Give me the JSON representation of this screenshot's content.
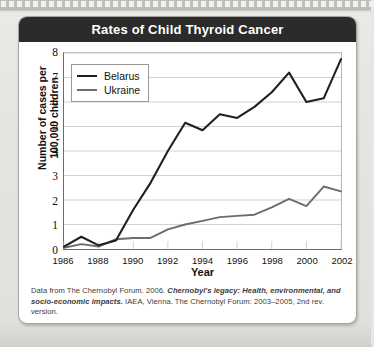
{
  "figure": {
    "title": "Rates of Child Thyroid Cancer",
    "caption_part1": "Data from The Chernobyl Forum. 2006. ",
    "caption_emphasis": "Chernobyl's legacy: Health, environmental, and socio-economic impacts.",
    "caption_part2": " IAEA, Vienna. The Chernobyl Forum: 2003–2005, 2nd rev. version."
  },
  "colors": {
    "header_bar": "#2b2b2b",
    "belarus_line": "#221f1f",
    "ukraine_line": "#6e6c6a",
    "gridline": "#cfcdcb",
    "axis": "#6e6c6a",
    "card_background": "#ffffff",
    "page_background": "#e8e6e3"
  },
  "chart_data": {
    "type": "line",
    "title": "Rates of Child Thyroid Cancer",
    "xlabel": "Year",
    "ylabel": "Number of cases per 100,000 children",
    "ylabel_line1": "Number of cases per",
    "ylabel_line2": "100,000 children",
    "xlim": [
      1986,
      2002
    ],
    "ylim": [
      0,
      8
    ],
    "ytick_labels": [
      "0",
      "1",
      "2",
      "3",
      "4",
      "5",
      "6",
      "7",
      "8"
    ],
    "yticks": [
      0,
      1,
      2,
      3,
      4,
      5,
      6,
      7,
      8
    ],
    "xtick_labels": [
      "1986",
      "1988",
      "1990",
      "1992",
      "1994",
      "1996",
      "1998",
      "2000",
      "2002"
    ],
    "xticks": [
      1986,
      1988,
      1990,
      1992,
      1994,
      1996,
      1998,
      2000,
      2002
    ],
    "grid": "horizontal",
    "legend_position": "upper-left-inside",
    "x": [
      1986,
      1987,
      1988,
      1989,
      1990,
      1991,
      1992,
      1993,
      1994,
      1995,
      1996,
      1997,
      1998,
      1999,
      2000,
      2001,
      2002
    ],
    "series": [
      {
        "name": "Belarus",
        "color": "#221f1f",
        "width": 2.1,
        "values": [
          0.1,
          0.5,
          0.15,
          0.35,
          1.6,
          2.7,
          4.0,
          5.15,
          4.85,
          5.5,
          5.35,
          5.8,
          6.4,
          7.2,
          6.0,
          6.15,
          7.75
        ]
      },
      {
        "name": "Ukraine",
        "color": "#6e6c6a",
        "width": 1.9,
        "values": [
          0.05,
          0.2,
          0.1,
          0.4,
          0.45,
          0.45,
          0.8,
          1.0,
          1.15,
          1.3,
          1.35,
          1.4,
          1.7,
          2.05,
          1.75,
          2.55,
          2.35
        ]
      }
    ]
  }
}
